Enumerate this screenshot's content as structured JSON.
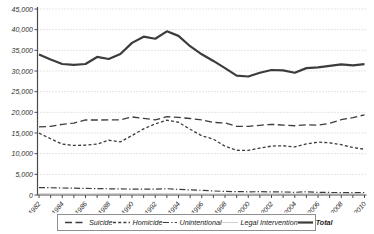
{
  "chart_data": {
    "type": "line",
    "title": "",
    "xlabel": "",
    "ylabel": "",
    "grid": "horizontal-dotted",
    "legend_position": "bottom",
    "x": [
      1982,
      1983,
      1984,
      1985,
      1986,
      1987,
      1988,
      1989,
      1990,
      1991,
      1992,
      1993,
      1994,
      1995,
      1996,
      1997,
      1998,
      1999,
      2000,
      2001,
      2002,
      2003,
      2004,
      2005,
      2006,
      2007,
      2008,
      2009,
      2010
    ],
    "x_tick_labels": [
      "1982",
      "1984",
      "1986",
      "1988",
      "1990",
      "1992",
      "1994",
      "1996",
      "1998",
      "2000",
      "2002",
      "2004",
      "2006",
      "2008",
      "2010"
    ],
    "y_axis": {
      "min": 0,
      "max": 45000,
      "step": 5000,
      "tick_labels": [
        "0",
        "5,000",
        "10,000",
        "15,000",
        "20,000",
        "25,000",
        "30,000",
        "35,000",
        "40,000",
        "45,000"
      ]
    },
    "series": [
      {
        "name": "Suicide",
        "dash": "long-dash",
        "color": "#3c3c3c",
        "width": 1.3,
        "values": [
          16500,
          16600,
          17100,
          17400,
          18150,
          18140,
          18170,
          18180,
          18885,
          18526,
          18169,
          18940,
          18765,
          18503,
          18166,
          17566,
          17424,
          16599,
          16586,
          16869,
          17108,
          16907,
          16750,
          17002,
          16883,
          17352,
          18223,
          18735,
          19392
        ]
      },
      {
        "name": "Homicide",
        "dash": "short-dash",
        "color": "#3c3c3c",
        "width": 1.3,
        "values": [
          14950,
          13600,
          12300,
          12000,
          12050,
          12300,
          13250,
          12850,
          14400,
          16000,
          17200,
          18100,
          17600,
          15900,
          14327,
          13522,
          11798,
          10828,
          10801,
          11348,
          11829,
          11920,
          11624,
          12352,
          12791,
          12632,
          12179,
          11493,
          11078
        ]
      },
      {
        "name": "Unintentional",
        "dash": "dash-dot",
        "color": "#3c3c3c",
        "width": 1.2,
        "values": [
          1800,
          1756,
          1700,
          1650,
          1600,
          1550,
          1501,
          1489,
          1416,
          1441,
          1409,
          1521,
          1356,
          1225,
          1134,
          981,
          866,
          824,
          776,
          802,
          762,
          730,
          649,
          789,
          642,
          613,
          592,
          554,
          606
        ]
      },
      {
        "name": "Legal Intervention",
        "dash": "solid",
        "color": "#c4c4c4",
        "width": 0.8,
        "values": [
          330,
          300,
          300,
          320,
          250,
          300,
          340,
          360,
          320,
          330,
          350,
          330,
          330,
          300,
          300,
          270,
          316,
          299,
          270,
          323,
          300,
          347,
          311,
          330,
          360,
          351,
          326,
          333,
          344
        ]
      },
      {
        "name": "Total",
        "dash": "solid",
        "color": "#3c3c3c",
        "width": 2.2,
        "values": [
          34000,
          32800,
          31700,
          31500,
          31700,
          33400,
          32900,
          34100,
          36800,
          38300,
          37800,
          39600,
          38500,
          36000,
          34040,
          32436,
          30708,
          28874,
          28663,
          29573,
          30242,
          30136,
          29569,
          30694,
          30896,
          31224,
          31593,
          31347,
          31672
        ]
      }
    ],
    "style": {
      "gridline_color": "#c9c9c9",
      "axis_color": "#4a4a4a",
      "background": "#ffffff"
    }
  }
}
